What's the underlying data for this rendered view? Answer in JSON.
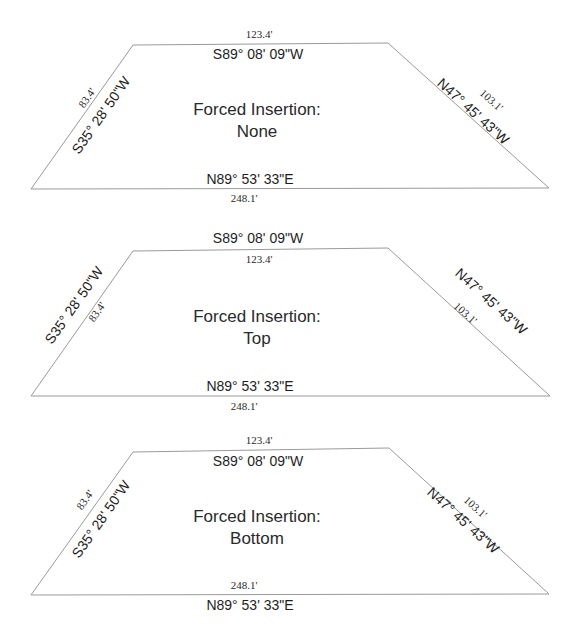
{
  "panels": [
    {
      "title_line1": "Forced Insertion:",
      "title_line2": "None",
      "top": {
        "bearing": "S89° 08' 09\"W",
        "distance": "123.4'"
      },
      "bottom": {
        "bearing": "N89° 53' 33\"E",
        "distance": "248.1'"
      },
      "left": {
        "bearing": "S35° 28' 50\"W",
        "distance": "83.4'"
      },
      "right": {
        "bearing": "N47° 45' 43\"W",
        "distance": "103.1'"
      }
    },
    {
      "title_line1": "Forced Insertion:",
      "title_line2": "Top",
      "top": {
        "bearing": "S89° 08' 09\"W",
        "distance": "123.4'"
      },
      "bottom": {
        "bearing": "N89° 53' 33\"E",
        "distance": "248.1'"
      },
      "left": {
        "bearing": "S35° 28' 50\"W",
        "distance": "83.4'"
      },
      "right": {
        "bearing": "N47° 45' 43\"W",
        "distance": "103.1'"
      }
    },
    {
      "title_line1": "Forced Insertion:",
      "title_line2": "Bottom",
      "top": {
        "bearing": "S89° 08' 09\"W",
        "distance": "123.4'"
      },
      "bottom": {
        "bearing": "N89° 53' 33\"E",
        "distance": "248.1'"
      },
      "left": {
        "bearing": "S35° 28' 50\"W",
        "distance": "83.4'"
      },
      "right": {
        "bearing": "N47° 45' 43\"W",
        "distance": "103.1'"
      }
    }
  ],
  "colors": {
    "line": "#9a9a9a",
    "text": "#1e1e1e",
    "background": "#ffffff"
  }
}
